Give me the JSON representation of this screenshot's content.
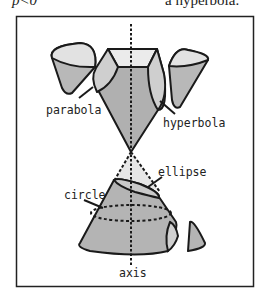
{
  "header": {
    "left_text": "p<0",
    "right_text": "a hyperbola."
  },
  "diagram": {
    "labels": {
      "parabola": "parabola",
      "hyperbola": "hyperbola",
      "ellipse": "ellipse",
      "circle": "circle",
      "axis": "axis"
    },
    "colors": {
      "frame": "#222222",
      "stroke": "#1a1a1a",
      "fill_dark": "#b4b4b4",
      "fill_mid": "#c8c8c8",
      "fill_light": "#e6e6e6",
      "background": "#ffffff"
    }
  }
}
